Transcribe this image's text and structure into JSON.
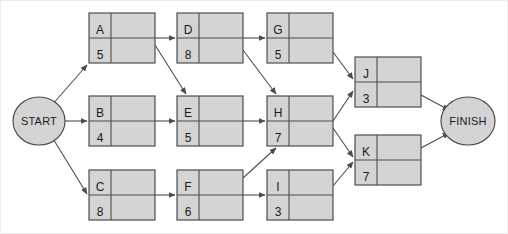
{
  "diagram": {
    "type": "activity-on-node-network",
    "colors": {
      "node_fill": "#d4d4d4",
      "node_stroke": "#4d4d4d",
      "terminal_fill": "#d4d4d4",
      "terminal_stroke": "#4d4d4d",
      "edge_stroke": "#4d4d4d",
      "text": "#1a1a1a",
      "background": "#ffffff",
      "border": "#e8e8e8"
    },
    "terminals": {
      "start": {
        "label": "START",
        "cx": 39,
        "cy": 121,
        "rx": 26,
        "ry": 24
      },
      "finish": {
        "label": "FINISH",
        "cx": 468,
        "cy": 121,
        "rx": 27,
        "ry": 24
      }
    },
    "nodes": [
      {
        "id": "A",
        "label": "A",
        "duration": "5",
        "x": 89,
        "y": 13,
        "w": 66,
        "h": 50
      },
      {
        "id": "D",
        "label": "D",
        "duration": "8",
        "x": 177,
        "y": 13,
        "w": 66,
        "h": 50
      },
      {
        "id": "G",
        "label": "G",
        "duration": "5",
        "x": 267,
        "y": 13,
        "w": 66,
        "h": 50
      },
      {
        "id": "B",
        "label": "B",
        "duration": "4",
        "x": 89,
        "y": 96,
        "w": 66,
        "h": 50
      },
      {
        "id": "E",
        "label": "E",
        "duration": "5",
        "x": 177,
        "y": 96,
        "w": 66,
        "h": 50
      },
      {
        "id": "H",
        "label": "H",
        "duration": "7",
        "x": 267,
        "y": 96,
        "w": 66,
        "h": 50
      },
      {
        "id": "C",
        "label": "C",
        "duration": "8",
        "x": 89,
        "y": 170,
        "w": 66,
        "h": 50
      },
      {
        "id": "F",
        "label": "F",
        "duration": "6",
        "x": 177,
        "y": 170,
        "w": 66,
        "h": 50
      },
      {
        "id": "I",
        "label": "I",
        "duration": "3",
        "x": 267,
        "y": 170,
        "w": 66,
        "h": 50
      },
      {
        "id": "J",
        "label": "J",
        "duration": "3",
        "x": 355,
        "y": 57,
        "w": 66,
        "h": 50
      },
      {
        "id": "K",
        "label": "K",
        "duration": "7",
        "x": 355,
        "y": 135,
        "w": 66,
        "h": 50
      }
    ],
    "edges": [
      {
        "from": "START",
        "to": "A",
        "x1": 52,
        "y1": 105,
        "x2": 87,
        "y2": 65
      },
      {
        "from": "START",
        "to": "B",
        "x1": 65,
        "y1": 121,
        "x2": 87,
        "y2": 121
      },
      {
        "from": "START",
        "to": "C",
        "x1": 52,
        "y1": 137,
        "x2": 87,
        "y2": 194
      },
      {
        "from": "A",
        "to": "D",
        "x1": 155,
        "y1": 38,
        "x2": 175,
        "y2": 38
      },
      {
        "from": "A",
        "to": "E",
        "x1": 155,
        "y1": 45,
        "x2": 186,
        "y2": 94
      },
      {
        "from": "B",
        "to": "E",
        "x1": 155,
        "y1": 121,
        "x2": 175,
        "y2": 121
      },
      {
        "from": "C",
        "to": "F",
        "x1": 155,
        "y1": 195,
        "x2": 175,
        "y2": 195
      },
      {
        "from": "D",
        "to": "G",
        "x1": 243,
        "y1": 38,
        "x2": 265,
        "y2": 38
      },
      {
        "from": "D",
        "to": "H",
        "x1": 243,
        "y1": 50,
        "x2": 276,
        "y2": 94
      },
      {
        "from": "E",
        "to": "H",
        "x1": 243,
        "y1": 121,
        "x2": 265,
        "y2": 121
      },
      {
        "from": "F",
        "to": "H",
        "x1": 243,
        "y1": 178,
        "x2": 276,
        "y2": 148
      },
      {
        "from": "F",
        "to": "I",
        "x1": 243,
        "y1": 195,
        "x2": 265,
        "y2": 195
      },
      {
        "from": "G",
        "to": "J",
        "x1": 333,
        "y1": 52,
        "x2": 353,
        "y2": 79
      },
      {
        "from": "H",
        "to": "J",
        "x1": 333,
        "y1": 121,
        "x2": 353,
        "y2": 91
      },
      {
        "from": "H",
        "to": "K",
        "x1": 333,
        "y1": 128,
        "x2": 353,
        "y2": 157
      },
      {
        "from": "I",
        "to": "K",
        "x1": 333,
        "y1": 186,
        "x2": 353,
        "y2": 162
      },
      {
        "from": "J",
        "to": "FINISH",
        "x1": 421,
        "y1": 95,
        "x2": 449,
        "y2": 110
      },
      {
        "from": "K",
        "to": "FINISH",
        "x1": 421,
        "y1": 148,
        "x2": 449,
        "y2": 133
      }
    ]
  }
}
